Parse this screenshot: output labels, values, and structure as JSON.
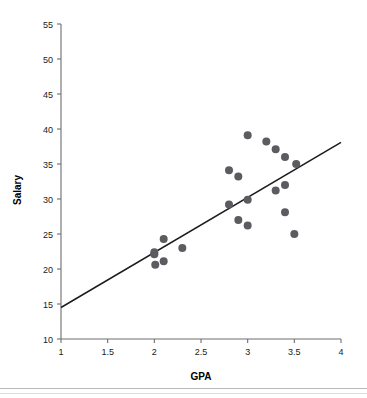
{
  "chart_data": {
    "type": "scatter",
    "title": "",
    "xlabel": "GPA",
    "ylabel": "Salary",
    "xlim": [
      1,
      4
    ],
    "ylim": [
      10,
      55
    ],
    "xticks": [
      1,
      1.5,
      2,
      2.5,
      3,
      3.5,
      4
    ],
    "xtick_labels": [
      "1",
      "1.5",
      "2",
      "2.5",
      "3",
      "3.5",
      "4"
    ],
    "yticks": [
      10,
      15,
      20,
      25,
      30,
      35,
      40,
      45,
      50,
      55
    ],
    "ytick_labels": [
      "10",
      "15",
      "20",
      "25",
      "30",
      "35",
      "40",
      "45",
      "50",
      "55"
    ],
    "grid": false,
    "legend": null,
    "marker_color": "#5b5b60",
    "line_color": "#1c1c1c",
    "points": [
      {
        "x": 2.01,
        "y": 20.6
      },
      {
        "x": 2.1,
        "y": 21.1
      },
      {
        "x": 2.0,
        "y": 22.1
      },
      {
        "x": 2.0,
        "y": 22.4
      },
      {
        "x": 2.1,
        "y": 24.3
      },
      {
        "x": 2.3,
        "y": 23.0
      },
      {
        "x": 2.8,
        "y": 34.1
      },
      {
        "x": 2.9,
        "y": 33.2
      },
      {
        "x": 2.8,
        "y": 29.2
      },
      {
        "x": 2.9,
        "y": 27.0
      },
      {
        "x": 3.0,
        "y": 26.2
      },
      {
        "x": 3.0,
        "y": 29.9
      },
      {
        "x": 3.0,
        "y": 39.1
      },
      {
        "x": 3.2,
        "y": 38.2
      },
      {
        "x": 3.3,
        "y": 37.1
      },
      {
        "x": 3.3,
        "y": 31.2
      },
      {
        "x": 3.4,
        "y": 36.0
      },
      {
        "x": 3.4,
        "y": 32.0
      },
      {
        "x": 3.4,
        "y": 28.1
      },
      {
        "x": 3.5,
        "y": 25.0
      },
      {
        "x": 3.52,
        "y": 35.0
      }
    ],
    "trendline": {
      "x_start": 1.0,
      "y_start": 14.5,
      "x_end": 4.0,
      "y_end": 38.1
    }
  }
}
